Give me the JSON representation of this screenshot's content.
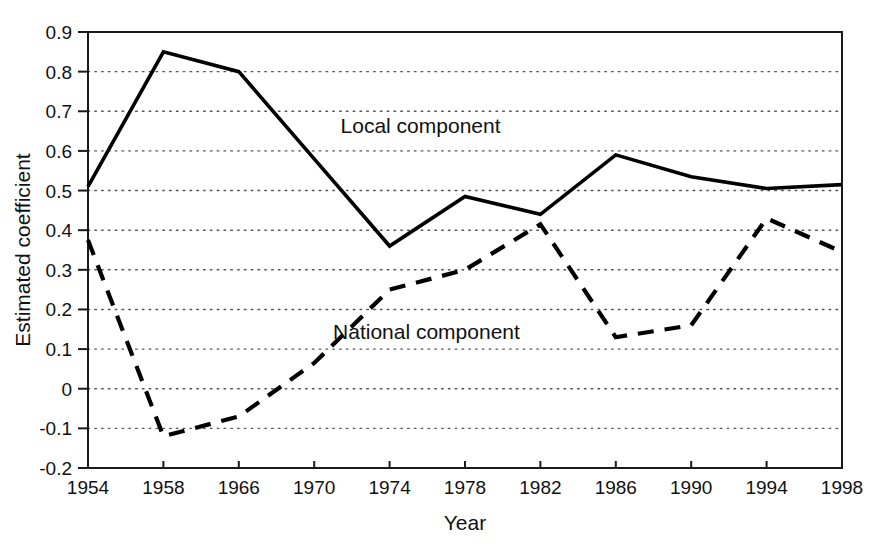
{
  "chart_data": {
    "type": "line",
    "title": "",
    "xlabel": "Year",
    "ylabel": "Estimated coefficient",
    "categories": [
      "1954",
      "1958",
      "1966",
      "1970",
      "1974",
      "1978",
      "1982",
      "1986",
      "1990",
      "1994",
      "1998"
    ],
    "x_tick_labels": [
      "1954",
      "1958",
      "1966",
      "1970",
      "1974",
      "1978",
      "1982",
      "1986",
      "1990",
      "1994",
      "1998"
    ],
    "y_tick_labels": [
      "0.9",
      "0.8",
      "0.7",
      "0.6",
      "0.5",
      "0.4",
      "0.3",
      "0.2",
      "0.1",
      "0",
      "-0.1",
      "-0.2"
    ],
    "y_tick_values": [
      0.9,
      0.8,
      0.7,
      0.6,
      0.5,
      0.4,
      0.3,
      0.2,
      0.1,
      0,
      -0.1,
      -0.2
    ],
    "ylim": [
      -0.2,
      0.9
    ],
    "xlim": [
      0,
      10
    ],
    "grid": true,
    "grid_axis": "y",
    "legend_position": "inline-annotations",
    "series": [
      {
        "name": "Local component",
        "style": "solid",
        "label_text": "Local component",
        "values": [
          0.51,
          0.85,
          0.8,
          0.58,
          0.36,
          0.485,
          0.44,
          0.59,
          0.535,
          0.505,
          0.515
        ]
      },
      {
        "name": "National component",
        "style": "dashed",
        "label_text": "National component",
        "values": [
          0.375,
          -0.12,
          -0.07,
          0.065,
          0.25,
          0.3,
          0.415,
          0.13,
          0.16,
          0.43,
          0.345
        ]
      }
    ],
    "annotations": [
      {
        "text": "Local component",
        "x_value": 3.35,
        "y_value": 0.645
      },
      {
        "text": "National component",
        "x_value": 3.25,
        "y_value": 0.125
      }
    ],
    "colors": {
      "line": "#000000",
      "grid": "#555555",
      "frame": "#1a1a1a",
      "background": "#ffffff",
      "text": "#111111"
    }
  }
}
